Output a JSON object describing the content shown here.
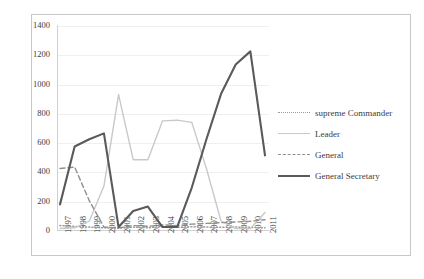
{
  "chart_data": {
    "type": "line",
    "title": "",
    "xlabel": "",
    "ylabel": "",
    "ylim": [
      0,
      1400
    ],
    "ytick_step": 200,
    "grid": true,
    "legend_position": "right",
    "categories": [
      "1997",
      "1998",
      "1999",
      "2000",
      "2001",
      "2002",
      "2003",
      "2004",
      "2005",
      "2006",
      "2007",
      "2008",
      "2009",
      "2010",
      "2011"
    ],
    "yticks": [
      "0",
      "200",
      "400",
      "600",
      "800",
      "1000",
      "1200",
      "1400"
    ],
    "series": [
      {
        "name": "supreme Commander",
        "style": "dotted",
        "color": "#9a9a9a",
        "values": [
          30,
          25,
          20,
          15,
          12,
          20,
          15,
          25,
          18,
          22,
          20,
          18,
          20,
          18,
          15
        ]
      },
      {
        "name": "Leader",
        "style": "solid-light",
        "color": "#c9c9c9",
        "values": [
          10,
          15,
          60,
          300,
          925,
          480,
          480,
          745,
          750,
          735,
          420,
          60,
          10,
          10,
          120
        ]
      },
      {
        "name": "General",
        "style": "dashed",
        "color": "#8f8f8f",
        "values": [
          420,
          430,
          200,
          20,
          15,
          30,
          25,
          35,
          30,
          40,
          45,
          50,
          55,
          60,
          70
        ]
      },
      {
        "name": "General Secretary",
        "style": "solid-dark",
        "color": "#5a5a5a",
        "values": [
          175,
          570,
          620,
          660,
          20,
          130,
          160,
          20,
          20,
          290,
          620,
          930,
          1130,
          1220,
          510
        ]
      }
    ]
  },
  "legend": {
    "items": [
      {
        "label": "supreme Commander",
        "swatch": "sw-dotted"
      },
      {
        "label": "Leader",
        "swatch": "sw-solid-light"
      },
      {
        "label": "General",
        "swatch": "sw-dashed"
      },
      {
        "label": "General Secretary",
        "swatch": "sw-solid-dark"
      }
    ]
  },
  "caption": {
    "text": ""
  }
}
